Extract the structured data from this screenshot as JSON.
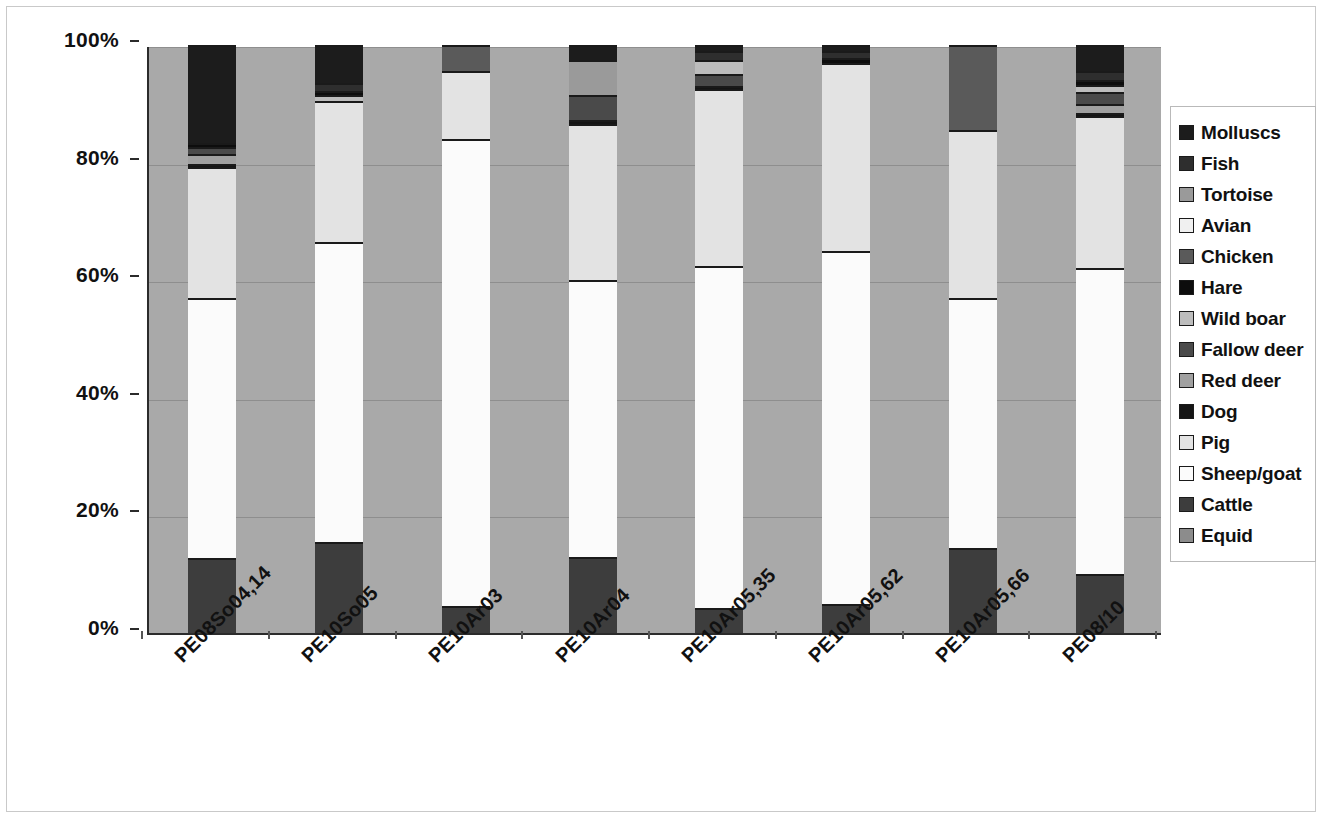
{
  "chart_data": {
    "type": "bar",
    "subtype": "stacked-percentage",
    "title": "",
    "xlabel": "",
    "ylabel": "",
    "ylim": [
      0,
      100
    ],
    "yticks": [
      "0%",
      "20%",
      "40%",
      "60%",
      "80%",
      "100%"
    ],
    "ytick_values": [
      0,
      20,
      40,
      60,
      80,
      100
    ],
    "grid": true,
    "legend_position": "right",
    "categories": [
      "PE08So04,14",
      "PE10So05",
      "PE10Ar03",
      "PE10Ar04",
      "PE10Ar05,35",
      "PE10Ar05,62",
      "PE10Ar05,66",
      "PE08/10"
    ],
    "series": [
      {
        "name": "Equid",
        "color": "#8c8c8c",
        "values": [
          0,
          0,
          0,
          0,
          0,
          0,
          0,
          0
        ]
      },
      {
        "name": "Cattle",
        "color": "#3d3d3d",
        "values": [
          12.8,
          15.5,
          4.6,
          13.0,
          4.2,
          5.0,
          14.5,
          10.0
        ]
      },
      {
        "name": "Sheep/goat",
        "color": "#fbfbfb",
        "values": [
          44.2,
          51.0,
          79.4,
          47.0,
          58.3,
          60.0,
          42.5,
          52.0
        ]
      },
      {
        "name": "Pig",
        "color": "#e3e3e3",
        "values": [
          22.2,
          24.0,
          11.5,
          26.5,
          30.0,
          32.0,
          28.5,
          26.0
        ]
      },
      {
        "name": "Dog",
        "color": "#151515",
        "values": [
          0.6,
          0.0,
          0.0,
          0.7,
          0.5,
          0.0,
          0.0,
          0.5
        ]
      },
      {
        "name": "Red deer",
        "color": "#a0a0a0",
        "values": [
          1.6,
          0.0,
          0.0,
          0.0,
          0.0,
          0.0,
          0.0,
          1.5
        ]
      },
      {
        "name": "Fallow deer",
        "color": "#4a4a4a",
        "values": [
          1.3,
          0.0,
          0.0,
          4.3,
          2.0,
          0.0,
          0.0,
          2.0
        ]
      },
      {
        "name": "Wild boar",
        "color": "#bdbdbd",
        "values": [
          0.0,
          1.0,
          0.0,
          0.0,
          2.5,
          0.0,
          0.0,
          1.2
        ]
      },
      {
        "name": "Hare",
        "color": "#0d0d0d",
        "values": [
          0.6,
          0.7,
          0.0,
          0.0,
          0.0,
          0.8,
          0.0,
          0.8
        ]
      },
      {
        "name": "Chicken",
        "color": "#5a5a5a",
        "values": [
          0.0,
          0.0,
          4.5,
          0.0,
          0.0,
          0.0,
          14.5,
          0.0
        ]
      },
      {
        "name": "Avian",
        "color": "#f0f0f0",
        "values": [
          0.0,
          0.0,
          0.0,
          0.0,
          0.0,
          0.0,
          0.0,
          0.0
        ]
      },
      {
        "name": "Tortoise",
        "color": "#9a9a9a",
        "values": [
          0.0,
          0.0,
          0.0,
          6.0,
          0.0,
          0.0,
          0.0,
          0.0
        ]
      },
      {
        "name": "Fish",
        "color": "#2e2e2e",
        "values": [
          0.0,
          1.3,
          0.0,
          0.0,
          1.5,
          1.2,
          0.0,
          1.5
        ]
      },
      {
        "name": "Molluscs",
        "color": "#1c1c1c",
        "values": [
          16.7,
          6.5,
          0.0,
          2.5,
          1.0,
          1.0,
          0.0,
          4.5
        ]
      }
    ],
    "legend_entries": [
      {
        "label": "Molluscs",
        "color": "#1c1c1c"
      },
      {
        "label": "Fish",
        "color": "#2e2e2e"
      },
      {
        "label": "Tortoise",
        "color": "#9a9a9a"
      },
      {
        "label": "Avian",
        "color": "#f0f0f0"
      },
      {
        "label": "Chicken",
        "color": "#5a5a5a"
      },
      {
        "label": "Hare",
        "color": "#0d0d0d"
      },
      {
        "label": "Wild boar",
        "color": "#bdbdbd"
      },
      {
        "label": "Fallow deer",
        "color": "#4a4a4a"
      },
      {
        "label": "Red deer",
        "color": "#a0a0a0"
      },
      {
        "label": "Dog",
        "color": "#151515"
      },
      {
        "label": "Pig",
        "color": "#e3e3e3"
      },
      {
        "label": "Sheep/goat",
        "color": "#fbfbfb"
      },
      {
        "label": "Cattle",
        "color": "#3d3d3d"
      },
      {
        "label": "Equid",
        "color": "#8c8c8c"
      }
    ],
    "plot_background_color": "#a9a9a9",
    "figure_background_color": "#ffffff",
    "axis_color": "#2b2b2b"
  }
}
